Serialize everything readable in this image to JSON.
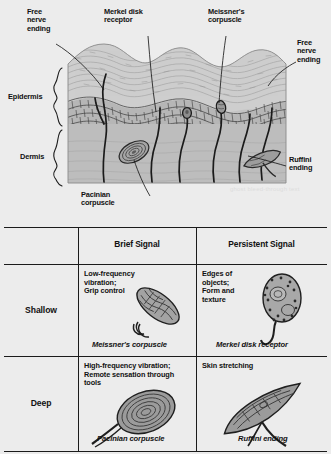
{
  "figure": {
    "diagram": {
      "name": "skin-cross-section",
      "layer_labels": [
        {
          "id": "epidermis",
          "text": "Epidermis"
        },
        {
          "id": "dermis",
          "text": "Dermis"
        }
      ],
      "callouts": [
        {
          "id": "free-nerve-ending-left",
          "text": "Free\nnerve\nending"
        },
        {
          "id": "merkel-disk-receptor",
          "text": "Merkel disk\nreceptor"
        },
        {
          "id": "meissners-corpuscle",
          "text": "Meissner's\ncorpuscle"
        },
        {
          "id": "free-nerve-ending-right",
          "text": "Free\nnerve\nending"
        },
        {
          "id": "ruffini-ending",
          "text": "Ruffini\nending"
        },
        {
          "id": "pacinian-corpuscle",
          "text": "Pacinian\ncorpuscle"
        }
      ]
    },
    "table": {
      "name": "mechanoreceptor-matrix",
      "corner_label": "",
      "columns": [
        {
          "id": "brief",
          "label": "Brief Signal"
        },
        {
          "id": "persistent",
          "label": "Persistent Signal"
        }
      ],
      "rows": [
        {
          "id": "shallow",
          "label": "Shallow"
        },
        {
          "id": "deep",
          "label": "Deep"
        }
      ],
      "cells": [
        {
          "id": "shallow-brief",
          "row": "Shallow",
          "column": "Brief Signal",
          "function": "Low-frequency\nvibration;\nGrip control",
          "receptor": "Meissner's corpuscle"
        },
        {
          "id": "shallow-persistent",
          "row": "Shallow",
          "column": "Persistent Signal",
          "function": "Edges of\nobjects;\nForm and\ntexture",
          "receptor": "Merkel disk receptor"
        },
        {
          "id": "deep-brief",
          "row": "Deep",
          "column": "Brief Signal",
          "function": "High-frequency vibration;\nRemote sensation through\ntools",
          "receptor": "Pacinian corpuscle"
        },
        {
          "id": "deep-persistent",
          "row": "Deep",
          "column": "Persistent Signal",
          "function": "Skin stretching",
          "receptor": "Ruffini ending"
        }
      ]
    },
    "ghost_text": "ghost bleed-through text"
  },
  "colors": {
    "page_background": "#ececec",
    "ink": "#1b1b1b",
    "skin_light": "#cfcfcf",
    "skin_mid": "#b9b9b9",
    "skin_dark": "#9a9a9a",
    "receptor_fill": "#9e9e9e"
  }
}
